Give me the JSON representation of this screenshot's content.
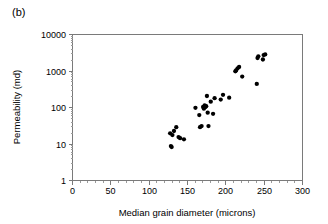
{
  "figure": {
    "panel_label": "(b)",
    "background_color": "#ffffff",
    "marker_color": "#000000",
    "axis_color": "#7a7a7a"
  },
  "chart_data": {
    "type": "scatter",
    "title": "",
    "panel_label": "(b)",
    "xlabel": "Median grain diameter (microns)",
    "ylabel": "Permeability (md)",
    "xlim": [
      0,
      300
    ],
    "ylim": [
      1,
      10000
    ],
    "xscale": "linear",
    "yscale": "log",
    "grid": false,
    "legend": null,
    "xticks": [
      0,
      50,
      100,
      150,
      200,
      250,
      300
    ],
    "xtick_labels": [
      "0",
      "50",
      "100",
      "150",
      "200",
      "250",
      "300"
    ],
    "yticks": [
      1,
      10,
      100,
      1000,
      10000
    ],
    "ytick_labels": [
      "1",
      "10",
      "100",
      "1000",
      "10000"
    ],
    "x": [
      128,
      129,
      130,
      131,
      133,
      136,
      139,
      141,
      146,
      161,
      166,
      167,
      169,
      171,
      172,
      173,
      174,
      175,
      176,
      177,
      178,
      181,
      184,
      186,
      194,
      197,
      205,
      213,
      214,
      216,
      218,
      222,
      241,
      242,
      243,
      249,
      250,
      252
    ],
    "y": [
      19,
      8.5,
      8,
      17,
      22,
      28,
      15,
      14,
      13,
      95,
      60,
      28,
      30,
      100,
      90,
      110,
      100,
      105,
      200,
      70,
      30,
      140,
      65,
      175,
      160,
      215,
      180,
      950,
      1000,
      1150,
      1250,
      680,
      430,
      2200,
      2450,
      2000,
      2650,
      2750
    ],
    "series": [
      {
        "name": "samples",
        "marker": "circle",
        "color": "#000000",
        "points": [
          [
            128,
            19
          ],
          [
            129,
            8.5
          ],
          [
            130,
            8
          ],
          [
            131,
            17
          ],
          [
            133,
            22
          ],
          [
            136,
            28
          ],
          [
            139,
            15
          ],
          [
            141,
            14
          ],
          [
            146,
            13
          ],
          [
            161,
            95
          ],
          [
            166,
            60
          ],
          [
            167,
            28
          ],
          [
            169,
            30
          ],
          [
            171,
            100
          ],
          [
            172,
            90
          ],
          [
            173,
            110
          ],
          [
            174,
            100
          ],
          [
            175,
            105
          ],
          [
            176,
            200
          ],
          [
            177,
            70
          ],
          [
            178,
            30
          ],
          [
            181,
            140
          ],
          [
            184,
            65
          ],
          [
            186,
            175
          ],
          [
            194,
            160
          ],
          [
            197,
            215
          ],
          [
            205,
            180
          ],
          [
            213,
            950
          ],
          [
            214,
            1000
          ],
          [
            216,
            1150
          ],
          [
            218,
            1250
          ],
          [
            222,
            680
          ],
          [
            241,
            430
          ],
          [
            242,
            2200
          ],
          [
            243,
            2450
          ],
          [
            249,
            2000
          ],
          [
            250,
            2650
          ],
          [
            252,
            2750
          ]
        ]
      }
    ],
    "n_points": 38
  }
}
